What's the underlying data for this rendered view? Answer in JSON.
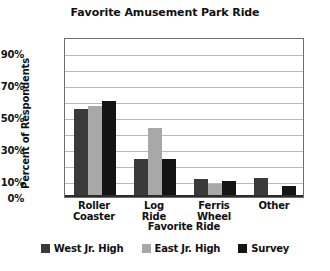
{
  "chart_data": {
    "type": "bar",
    "title": "Favorite Amusement Park Ride",
    "xlabel": "Favorite Ride",
    "ylabel": "Percent of Respondents",
    "categories": [
      "Roller Coaster",
      "Log Ride",
      "Ferris Wheel",
      "Other"
    ],
    "category_lines": [
      [
        "Roller",
        "Coaster"
      ],
      [
        "Log",
        "Ride"
      ],
      [
        "Ferris",
        "Wheel"
      ],
      [
        "Other",
        ""
      ]
    ],
    "series": [
      {
        "name": "West Jr. High",
        "color": "#3a3a3a",
        "values": [
          55,
          24,
          11,
          12
        ]
      },
      {
        "name": "East Jr. High",
        "color": "#a8a8a8",
        "values": [
          57,
          43,
          8,
          0
        ]
      },
      {
        "name": "Survey",
        "color": "#141414",
        "values": [
          60,
          24,
          10,
          7
        ]
      }
    ],
    "ylim": [
      0,
      100
    ],
    "y_tick_labels": [
      "90%",
      "70%",
      "50%",
      "30%",
      "10%",
      "0%"
    ],
    "y_tick_values": [
      90,
      70,
      50,
      30,
      10,
      0
    ],
    "gridline_values": [
      10,
      20,
      30,
      40,
      50,
      60,
      70,
      80,
      90
    ],
    "grid": true,
    "legend_position": "bottom"
  },
  "legend": {
    "items": [
      {
        "label": "West Jr. High",
        "color": "#3a3a3a"
      },
      {
        "label": "East Jr. High",
        "color": "#a8a8a8"
      },
      {
        "label": "Survey",
        "color": "#141414"
      }
    ]
  }
}
